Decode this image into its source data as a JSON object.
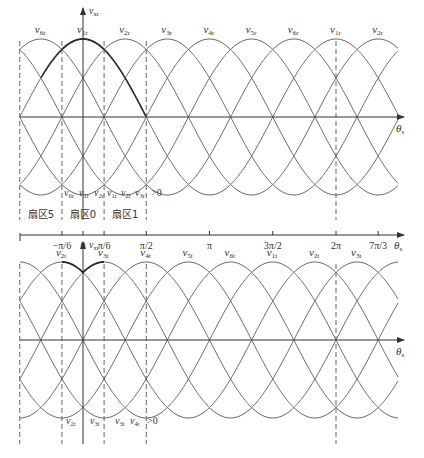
{
  "figure": {
    "top_plot": {
      "y_axis_label": "v",
      "y_axis_sub": "xr",
      "x_axis_label": "θ",
      "x_axis_sub": "s",
      "center_y": 117,
      "amplitude": 78,
      "curves": [
        {
          "name": "v",
          "sub": "1r",
          "peak_deg": 0
        },
        {
          "name": "v",
          "sub": "2r",
          "peak_deg": 60
        },
        {
          "name": "v",
          "sub": "3r",
          "peak_deg": 120
        },
        {
          "name": "v",
          "sub": "4r",
          "peak_deg": 180
        },
        {
          "name": "v",
          "sub": "5r",
          "peak_deg": 240
        },
        {
          "name": "v",
          "sub": "6r",
          "peak_deg": 300
        }
      ],
      "peak_labels": [
        {
          "sub": "6r",
          "deg": -60
        },
        {
          "sub": "1r",
          "deg": 0
        },
        {
          "sub": "2r",
          "deg": 60
        },
        {
          "sub": "3r",
          "deg": 120
        },
        {
          "sub": "4r",
          "deg": 180
        },
        {
          "sub": "5r",
          "deg": 240
        },
        {
          "sub": "6r",
          "deg": 300
        },
        {
          "sub": "1r",
          "deg": 360
        },
        {
          "sub": "2r",
          "deg": 420
        }
      ],
      "dashed_lines_deg": [
        -90,
        -30,
        30,
        90,
        360
      ],
      "condition_labels": [
        {
          "text": "v6r v1r v2r",
          "parts": [
            [
              "v",
              "6r"
            ],
            [
              "v",
              "1r"
            ],
            [
              "v",
              "2r"
            ]
          ]
        },
        {
          "text": "v1r v2r v3r >0",
          "parts": [
            [
              "v",
              "1r"
            ],
            [
              "v",
              "2r"
            ],
            [
              "v",
              "3r"
            ]
          ],
          "suffix": ">0"
        }
      ]
    },
    "sector_axis": {
      "sectors": [
        "扇区5",
        "扇区0",
        "扇区1"
      ],
      "ticks": [
        {
          "label": "−π/6",
          "deg": -30
        },
        {
          "label": "0",
          "deg": 0
        },
        {
          "label": "π/6",
          "deg": 30
        },
        {
          "label": "π/2",
          "deg": 90
        },
        {
          "label": "π",
          "deg": 180
        },
        {
          "label": "3π/2",
          "deg": 270
        },
        {
          "label": "2π",
          "deg": 360
        },
        {
          "label": "7π/3",
          "deg": 420
        }
      ],
      "axis_label": "θ",
      "axis_sub": "s"
    },
    "bottom_plot": {
      "y_axis_label": "v",
      "y_axis_sub": "xt",
      "x_axis_label": "θ",
      "x_axis_sub": "s",
      "center_y": 340,
      "amplitude": 78,
      "peak_labels": [
        {
          "sub": "2t",
          "deg": -30
        },
        {
          "sub": "3t",
          "deg": 30
        },
        {
          "sub": "4t",
          "deg": 90
        },
        {
          "sub": "5t",
          "deg": 150
        },
        {
          "sub": "6t",
          "deg": 210
        },
        {
          "sub": "1t",
          "deg": 270
        },
        {
          "sub": "2t",
          "deg": 330
        },
        {
          "sub": "3t",
          "deg": 390
        }
      ],
      "dashed_lines_deg": [
        -90,
        -30,
        30,
        90,
        360
      ],
      "condition_labels": [
        {
          "parts": [
            [
              "v",
              "2t"
            ]
          ]
        },
        {
          "parts": [
            [
              "v",
              "3t"
            ]
          ]
        },
        {
          "parts": [
            [
              "v",
              "3t"
            ],
            [
              "v",
              "4t"
            ]
          ],
          "suffix": ">0"
        }
      ]
    },
    "colors": {
      "curve": "#6b6b6b",
      "bold_curve": "#2a2a2a",
      "axis": "#333333",
      "dashed": "#555555",
      "text": "#333333"
    }
  }
}
